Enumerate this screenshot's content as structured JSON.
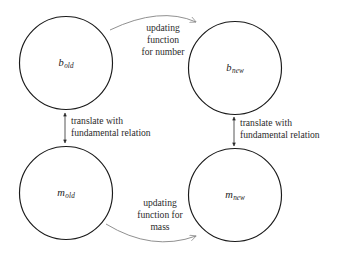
{
  "diagram": {
    "background_color": "#ffffff",
    "node_stroke_color": "#1a1a1a",
    "curve_arrow_color": "#8a8a8a",
    "vertical_arrow_color": "#2b2b2b",
    "nodes": [
      {
        "id": "b-old",
        "label_base": "b",
        "label_sub": "old",
        "cx": 66,
        "cy": 63,
        "r": 46.5
      },
      {
        "id": "b-new",
        "label_base": "b",
        "label_sub": "new",
        "cx": 235,
        "cy": 68,
        "r": 46.5
      },
      {
        "id": "m-old",
        "label_base": "m",
        "label_sub": "old",
        "cx": 66,
        "cy": 193,
        "r": 46.5
      },
      {
        "id": "m-new",
        "label_base": "m",
        "label_sub": "new",
        "cx": 235,
        "cy": 195,
        "r": 46.5
      }
    ],
    "edges": {
      "top": {
        "label": "updating\nfunction\nfor number",
        "label_x": 163,
        "label_y": 40,
        "from": "b-old",
        "to": "b-new"
      },
      "bottom": {
        "label": "updating\nfunction for\nmass",
        "label_x": 160,
        "label_y": 215,
        "from": "m-old",
        "to": "m-new"
      },
      "left": {
        "label": "translate with\nfundamental relation",
        "label_x": 71,
        "label_y": 127,
        "from": "b-old",
        "to": "m-old"
      },
      "right": {
        "label": "translate with\nfundamental relation",
        "label_x": 240,
        "label_y": 129,
        "from": "b-new",
        "to": "m-new"
      }
    }
  }
}
